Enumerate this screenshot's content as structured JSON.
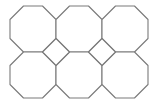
{
  "diagram": {
    "title": "",
    "stroke_color": "#7a7a7a",
    "fill_color": "#ffffff",
    "background": "#ffffff",
    "octagon_size": 46,
    "octagon_cut": 13.5,
    "octagons": [
      {
        "row": 0,
        "col": 0,
        "x": 10,
        "y": 6
      },
      {
        "row": 0,
        "col": 1,
        "x": 56,
        "y": 6
      },
      {
        "row": 0,
        "col": 2,
        "x": 102,
        "y": 6
      },
      {
        "row": 1,
        "col": 0,
        "x": 10,
        "y": 52
      },
      {
        "row": 1,
        "col": 1,
        "x": 56,
        "y": 52
      },
      {
        "row": 1,
        "col": 2,
        "x": 102,
        "y": 52
      }
    ],
    "squares": [
      {
        "cx": 56,
        "cy": 52
      },
      {
        "cx": 102,
        "cy": 52
      }
    ]
  }
}
